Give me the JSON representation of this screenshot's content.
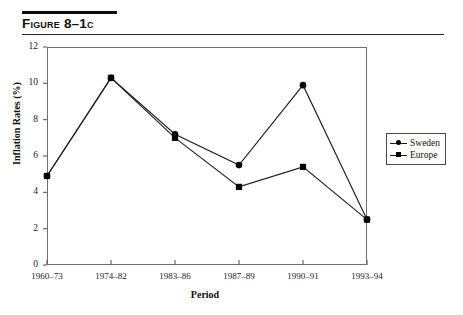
{
  "figure": {
    "title": "Figure 8–1c"
  },
  "legend": {
    "position": "right-outside",
    "items": [
      {
        "label": "Sweden",
        "marker": "circle-marker-icon"
      },
      {
        "label": "Europe",
        "marker": "square-marker-icon"
      }
    ]
  },
  "chart_data": {
    "type": "line",
    "title": "Figure 8–1c",
    "xlabel": "Period",
    "ylabel": "Inflation Rates (%)",
    "categories": [
      "1960–73",
      "1974–82",
      "1983–86",
      "1987–89",
      "1990–91",
      "1993–94"
    ],
    "ylim": [
      0,
      12
    ],
    "yticks": [
      0,
      2,
      4,
      6,
      8,
      10,
      12
    ],
    "ytick_labels": [
      "0",
      "2",
      "4",
      "6",
      "8",
      "10",
      "12"
    ],
    "grid": false,
    "series": [
      {
        "name": "Sweden",
        "marker": "circle",
        "values": [
          4.9,
          10.3,
          7.2,
          5.5,
          9.9,
          2.5
        ]
      },
      {
        "name": "Europe",
        "marker": "square",
        "values": [
          4.9,
          10.3,
          7.0,
          4.3,
          5.4,
          2.5
        ]
      }
    ]
  }
}
